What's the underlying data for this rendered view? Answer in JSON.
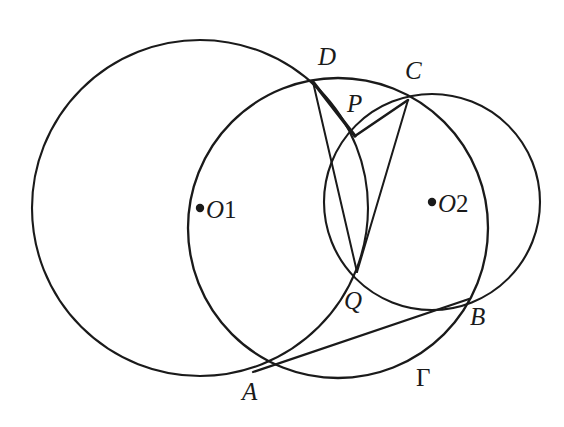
{
  "figure": {
    "kind": "euclidean-geometry-diagram",
    "stroke_color": "#1a1a1a",
    "background_color": "#ffffff",
    "width": 564,
    "height": 427
  },
  "circles": [
    {
      "id": "circle-o1",
      "label": "O_1",
      "center_label": "O",
      "center_subscript": "1",
      "cx": 200,
      "cy": 208,
      "r": 168,
      "stroke_width": 2.1,
      "center_dot_x": 200,
      "center_dot_y": 208,
      "label_x": 206,
      "label_y": 197
    },
    {
      "id": "circle-o2",
      "label": "O_2",
      "center_label": "O",
      "center_subscript": "2",
      "cx": 432,
      "cy": 202,
      "r": 108,
      "stroke_width": 2.1,
      "center_dot_x": 432,
      "center_dot_y": 202,
      "label_x": 438,
      "label_y": 191
    },
    {
      "id": "circle-gamma",
      "label": "Γ",
      "cx": 338,
      "cy": 228,
      "r": 150,
      "stroke_width": 2.3,
      "label_x": 416,
      "label_y": 365
    }
  ],
  "points": [
    {
      "id": "point-d",
      "label": "D",
      "x": 313,
      "y": 82,
      "label_x": 318,
      "label_y": 44,
      "dot": false
    },
    {
      "id": "point-c",
      "label": "C",
      "x": 408,
      "y": 100,
      "label_x": 405,
      "label_y": 58,
      "dot": false
    },
    {
      "id": "point-p",
      "label": "P",
      "x": 355,
      "y": 136,
      "label_x": 347,
      "label_y": 91,
      "dot": false
    },
    {
      "id": "point-q",
      "label": "Q",
      "x": 357,
      "y": 272,
      "label_x": 344,
      "label_y": 288,
      "dot": false
    },
    {
      "id": "point-a",
      "label": "A",
      "x": 253,
      "y": 372,
      "label_x": 242,
      "label_y": 379,
      "dot": false
    },
    {
      "id": "point-b",
      "label": "B",
      "x": 465,
      "y": 302,
      "label_x": 470,
      "label_y": 304,
      "dot": false
    }
  ],
  "segments": [
    {
      "id": "segment-dq",
      "from": "D",
      "to": "Q",
      "x1": 313,
      "y1": 82,
      "x2": 357,
      "y2": 272,
      "stroke_width": 2.0
    },
    {
      "id": "segment-cq",
      "from": "C",
      "to": "Q",
      "x1": 408,
      "y1": 100,
      "x2": 357,
      "y2": 272,
      "stroke_width": 2.0
    },
    {
      "id": "segment-dp",
      "from": "D",
      "to": "P",
      "x1": 313,
      "y1": 82,
      "x2": 355,
      "y2": 136,
      "stroke_width": 3.4
    },
    {
      "id": "segment-cp",
      "from": "C",
      "to": "P",
      "x1": 408,
      "y1": 100,
      "x2": 355,
      "y2": 136,
      "stroke_width": 2.6
    },
    {
      "id": "segment-ab",
      "from": "A",
      "to": "B",
      "x1": 253,
      "y1": 372,
      "x2": 469,
      "y2": 299,
      "stroke_width": 2.3
    }
  ],
  "labels": {
    "d": "D",
    "c": "C",
    "p": "P",
    "q": "Q",
    "a": "A",
    "b": "B",
    "gamma": "Γ",
    "o": "O",
    "sub1": "1",
    "sub2": "2"
  }
}
